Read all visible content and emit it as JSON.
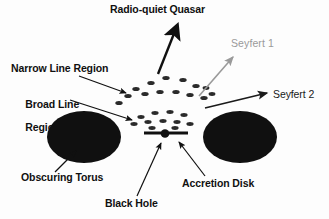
{
  "figure": {
    "background": "#ffffff",
    "ink": "#101010",
    "gray": "#9a9a9a"
  },
  "labels": {
    "quasar": "Radio-quiet Quasar",
    "seyfert1": "Seyfert 1",
    "seyfert2": "Seyfert 2",
    "narrow_line_region": "Narrow Line Region",
    "broad_line_region_l1": "Broad Line",
    "broad_line_region_l2": "Region",
    "obscuring_torus": "Obscuring Torus",
    "black_hole": "Black Hole",
    "accretion_disk": "Accretion Disk"
  },
  "components": {
    "black_hole": {
      "shape": "filled-circle",
      "cx": 165,
      "cy": 134,
      "r": 4.2,
      "color": "#101010"
    },
    "accretion_disk": {
      "shape": "horizontal-bar",
      "x1": 144,
      "x2": 188,
      "y": 133,
      "thickness": 3.2,
      "color": "#101010"
    },
    "torus_left": {
      "shape": "filled-ellipse",
      "cx": 84,
      "cy": 137,
      "rx": 37,
      "ry": 26,
      "color": "#101010"
    },
    "torus_right": {
      "shape": "filled-ellipse",
      "cx": 240,
      "cy": 137,
      "rx": 37,
      "ry": 26,
      "color": "#101010"
    }
  },
  "clouds": {
    "style": {
      "shape": "small-ellipse",
      "rx": 3.6,
      "ry": 1.9,
      "color": "#2a2a2a"
    },
    "narrow_line_region": [
      [
        136,
        89
      ],
      [
        151,
        83
      ],
      [
        166,
        78
      ],
      [
        183,
        80
      ],
      [
        196,
        86
      ],
      [
        128,
        96
      ],
      [
        145,
        94
      ],
      [
        160,
        92
      ],
      [
        176,
        92
      ],
      [
        190,
        95
      ],
      [
        204,
        98
      ],
      [
        119,
        103
      ],
      [
        206,
        88
      ],
      [
        212,
        94
      ]
    ],
    "broad_line_region": [
      [
        141,
        117
      ],
      [
        155,
        113
      ],
      [
        170,
        112
      ],
      [
        184,
        115
      ],
      [
        134,
        124
      ],
      [
        148,
        122
      ],
      [
        163,
        121
      ],
      [
        177,
        122
      ],
      [
        190,
        124
      ],
      [
        152,
        128
      ],
      [
        175,
        128
      ]
    ]
  },
  "arrows": {
    "quasar_beam": {
      "from": [
        158,
        74
      ],
      "to": [
        178,
        24
      ],
      "color": "#101010",
      "width": 2.4,
      "head": "solid-large"
    },
    "seyfert1_beam": {
      "from": [
        199,
        96
      ],
      "to": [
        234,
        56
      ],
      "color": "#9a9a9a",
      "width": 1.5,
      "head": "solid"
    },
    "seyfert2_beam": {
      "from": [
        205,
        108
      ],
      "to": [
        268,
        92
      ],
      "color": "#1a1a1a",
      "width": 1.6,
      "head": "solid"
    },
    "nlr_leader": {
      "from": [
        79,
        76
      ],
      "to": [
        127,
        94
      ],
      "color": "#101010",
      "width": 1.2,
      "head": "solid"
    },
    "blr_leader": {
      "from": [
        70,
        100
      ],
      "to": [
        133,
        121
      ],
      "color": "#101010",
      "width": 1.2,
      "head": "solid"
    },
    "torus_leader": {
      "from": [
        55,
        172
      ],
      "to": [
        75,
        150
      ],
      "color": "#101010",
      "width": 1.2,
      "head": "solid"
    },
    "bh_leader": {
      "from": [
        137,
        196
      ],
      "to": [
        161,
        142
      ],
      "color": "#101010",
      "width": 1.2,
      "head": "solid"
    },
    "disk_leader": {
      "from": [
        205,
        176
      ],
      "to": [
        178,
        141
      ],
      "color": "#101010",
      "width": 1.2,
      "head": "solid"
    }
  }
}
